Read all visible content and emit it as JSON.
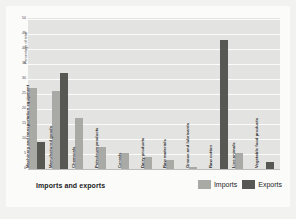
{
  "chart_data": {
    "type": "bar",
    "title": "Imports and exports",
    "xlabel": "",
    "ylabel": "Percentage of total",
    "ylim": [
      0,
      50
    ],
    "yticks": [
      0,
      5,
      10,
      15,
      20,
      25,
      30,
      35,
      40,
      45,
      50
    ],
    "grid": true,
    "legend_position": "bottom-right",
    "categories": [
      "Machinery and transportation equipment",
      "Manufactured goods",
      "Chemicals",
      "Petroleum products",
      "Cereals",
      "Dairy products",
      "Raw materials",
      "Grease and lubricants",
      "Raw cotton",
      "Live animals",
      "Vegetable food products"
    ],
    "series": [
      {
        "name": "Imports",
        "color": "#a9a9a6",
        "values": [
          27,
          26,
          17,
          7.5,
          5.5,
          4,
          3,
          0.7,
          0,
          5.5,
          0
        ]
      },
      {
        "name": "Exports",
        "color": "#575754",
        "values": [
          9,
          32,
          0,
          0,
          0,
          0,
          0,
          0,
          43,
          0,
          2.5
        ]
      }
    ]
  },
  "legend": {
    "items": [
      {
        "label": "Imports",
        "color": "#a9a9a6"
      },
      {
        "label": "Exports",
        "color": "#575754"
      }
    ]
  }
}
